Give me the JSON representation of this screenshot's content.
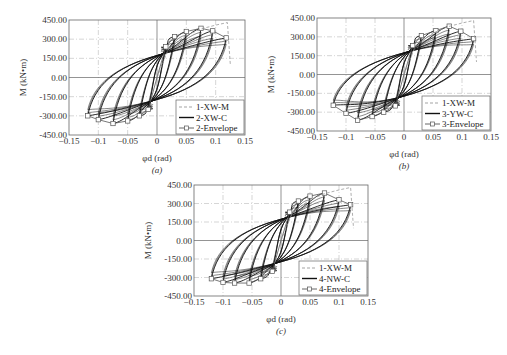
{
  "chart_data": [
    {
      "id": "a",
      "type": "line",
      "caption": "(a)",
      "xlabel": "φd (rad)",
      "ylabel": "M (kN•m)",
      "xlim": [
        -0.15,
        0.15
      ],
      "ylim": [
        -450,
        450
      ],
      "xticks": [
        "−0.15",
        "−0.1",
        "−0.05",
        "0",
        "0.05",
        "0.1",
        "0.15"
      ],
      "yticks": [
        "450.00",
        "300.00",
        "150.00",
        "0.00",
        "-150.00",
        "-300.00",
        "-450.00"
      ],
      "grid": true,
      "legend": [
        "1-XW-M",
        "2-XW-C",
        "2-Envelope"
      ],
      "legend_position": "lower right",
      "series": [
        {
          "name": "1-XW-M",
          "style": "dashed",
          "x": [
            0,
            0.02,
            0.05,
            0.075,
            0.1,
            0.12
          ],
          "y": [
            0,
            230,
            330,
            380,
            410,
            430
          ]
        },
        {
          "name": "2-XW-C",
          "style": "solid",
          "cycles_pos_peak_x": [
            0.015,
            0.03,
            0.05,
            0.075,
            0.095,
            0.118
          ],
          "cycles_pos_peak_y": [
            240,
            320,
            360,
            385,
            365,
            310
          ],
          "cycles_neg_peak_x": [
            -0.015,
            -0.03,
            -0.05,
            -0.075,
            -0.1,
            -0.118
          ],
          "cycles_neg_peak_y": [
            -250,
            -300,
            -340,
            -360,
            -330,
            -300
          ]
        },
        {
          "name": "2-Envelope",
          "style": "solid-square-marker",
          "x": [
            -0.118,
            -0.1,
            -0.075,
            -0.05,
            -0.03,
            -0.015,
            0,
            0.015,
            0.03,
            0.05,
            0.075,
            0.095,
            0.118
          ],
          "y": [
            -300,
            -330,
            -360,
            -340,
            -300,
            -250,
            0,
            240,
            320,
            360,
            385,
            365,
            310
          ]
        }
      ]
    },
    {
      "id": "b",
      "type": "line",
      "caption": "(b)",
      "xlabel": "φd (rad)",
      "ylabel": "M (kN•m)",
      "xlim": [
        -0.15,
        0.15
      ],
      "ylim": [
        -450,
        450
      ],
      "xticks": [
        "−0.15",
        "−0.1",
        "−0.05",
        "0",
        "0.05",
        "0.1",
        "0.15"
      ],
      "yticks": [
        "450.00",
        "300.00",
        "150.00",
        "0.00",
        "-150.00",
        "-300.00",
        "-450.00"
      ],
      "grid": true,
      "legend": [
        "1-XW-M",
        "3-YW-C",
        "3-Envelope"
      ],
      "legend_position": "lower right",
      "series": [
        {
          "name": "1-XW-M",
          "style": "dashed",
          "x": [
            0,
            0.02,
            0.05,
            0.075,
            0.1,
            0.12
          ],
          "y": [
            0,
            230,
            330,
            380,
            410,
            430
          ]
        },
        {
          "name": "3-YW-C",
          "style": "solid",
          "cycles_pos_peak_x": [
            0.015,
            0.03,
            0.055,
            0.078,
            0.098,
            0.12
          ],
          "cycles_pos_peak_y": [
            230,
            310,
            350,
            385,
            345,
            285
          ],
          "cycles_neg_peak_x": [
            -0.015,
            -0.035,
            -0.055,
            -0.08,
            -0.1,
            -0.122
          ],
          "cycles_neg_peak_y": [
            -250,
            -300,
            -335,
            -365,
            -310,
            -245
          ]
        },
        {
          "name": "3-Envelope",
          "style": "solid-square-marker",
          "x": [
            -0.122,
            -0.1,
            -0.08,
            -0.055,
            -0.035,
            -0.015,
            0,
            0.015,
            0.03,
            0.055,
            0.078,
            0.098,
            0.12
          ],
          "y": [
            -245,
            -310,
            -365,
            -335,
            -300,
            -250,
            0,
            230,
            310,
            350,
            385,
            345,
            285
          ]
        }
      ]
    },
    {
      "id": "c",
      "type": "line",
      "caption": "(c)",
      "xlabel": "φd (rad)",
      "ylabel": "M (kN•m)",
      "xlim": [
        -0.15,
        0.15
      ],
      "ylim": [
        -450,
        450
      ],
      "xticks": [
        "−0.15",
        "−0.1",
        "−0.05",
        "0",
        "0.05",
        "0.1",
        "0.15"
      ],
      "yticks": [
        "450.00",
        "300.00",
        "150.00",
        "0.00",
        "-150.00",
        "-300.00",
        "-450.00"
      ],
      "grid": true,
      "legend": [
        "1-XW-M",
        "4-NW-C",
        "4-Envelope"
      ],
      "legend_position": "lower right",
      "series": [
        {
          "name": "1-XW-M",
          "style": "dashed",
          "x": [
            0,
            0.02,
            0.05,
            0.075,
            0.1,
            0.12
          ],
          "y": [
            0,
            230,
            330,
            380,
            410,
            430
          ]
        },
        {
          "name": "4-NW-C",
          "style": "solid",
          "cycles_pos_peak_x": [
            0.015,
            0.03,
            0.05,
            0.075,
            0.1,
            0.12
          ],
          "cycles_pos_peak_y": [
            230,
            320,
            360,
            385,
            330,
            290
          ],
          "cycles_neg_peak_x": [
            -0.015,
            -0.035,
            -0.055,
            -0.08,
            -0.1,
            -0.12
          ],
          "cycles_neg_peak_y": [
            -250,
            -310,
            -345,
            -345,
            -340,
            -310
          ]
        },
        {
          "name": "4-Envelope",
          "style": "solid-square-marker",
          "x": [
            -0.12,
            -0.1,
            -0.08,
            -0.055,
            -0.035,
            -0.015,
            0,
            0.015,
            0.03,
            0.05,
            0.075,
            0.1,
            0.12
          ],
          "y": [
            -310,
            -340,
            -345,
            -345,
            -310,
            -250,
            0,
            230,
            320,
            360,
            385,
            330,
            290
          ]
        }
      ]
    }
  ],
  "layout": {
    "panels": [
      {
        "id": "a",
        "left": 69,
        "top": 20,
        "right": 245,
        "bottom": 135
      },
      {
        "id": "b",
        "left": 317,
        "top": 18,
        "right": 491,
        "bottom": 131
      },
      {
        "id": "c",
        "left": 194,
        "top": 185,
        "right": 368,
        "bottom": 296
      }
    ]
  }
}
